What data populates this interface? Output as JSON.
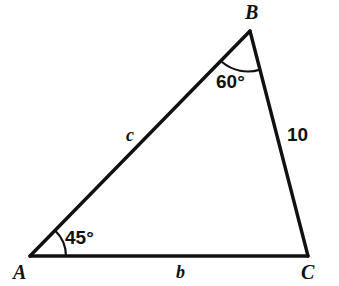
{
  "figure": {
    "kind": "triangle-diagram",
    "stroke_color": "#111111",
    "background_color": "#ffffff",
    "stroke_width": 3,
    "vertices": {
      "A": {
        "label": "A",
        "x": 30,
        "y": 256
      },
      "B": {
        "label": "B",
        "x": 250,
        "y": 31
      },
      "C": {
        "label": "C",
        "x": 308,
        "y": 256
      }
    },
    "sides": [
      {
        "name": "side-AB",
        "label": "c",
        "from": "A",
        "to": "B",
        "label_x": 126,
        "label_y": 126
      },
      {
        "name": "side-AC",
        "label": "b",
        "from": "A",
        "to": "C",
        "label_x": 176,
        "label_y": 263
      },
      {
        "name": "side-BC",
        "label": "10",
        "from": "B",
        "to": "C",
        "label_x": 287,
        "label_y": 125
      }
    ],
    "angles": [
      {
        "name": "angle-at-A",
        "vertex": "A",
        "label": "45°",
        "value": 45,
        "unit": "degrees",
        "arc_radius": 36,
        "label_x": 65,
        "label_y": 228
      },
      {
        "name": "angle-at-B",
        "vertex": "B",
        "label": "60°",
        "value": 60,
        "unit": "degrees",
        "arc_radius": 40,
        "label_x": 216,
        "label_y": 72
      }
    ]
  }
}
